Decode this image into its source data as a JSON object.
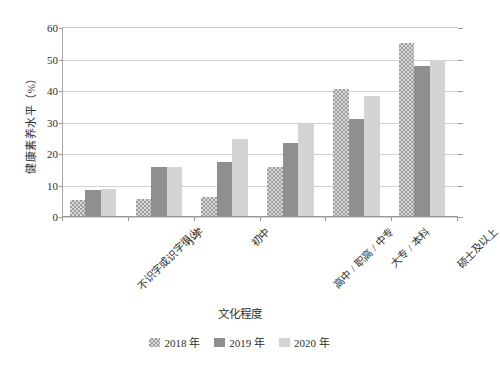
{
  "chart_data": {
    "type": "bar",
    "title": "",
    "xlabel": "文化程度",
    "ylabel": "健康素养水平（%）",
    "categories": [
      "不识字或识字很少",
      "小学",
      "初中",
      "高中 / 职高 / 中专",
      "大专 / 本科",
      "硕士及以上"
    ],
    "series": [
      {
        "name": "2018 年",
        "color": "#d9d9d9",
        "pattern": "checkered",
        "values": [
          5.5,
          5.7,
          6.5,
          16.0,
          40.5,
          55.4
        ]
      },
      {
        "name": "2019 年",
        "color": "#8f8f8f",
        "pattern": "solid",
        "values": [
          8.5,
          15.8,
          17.5,
          23.5,
          31.0,
          48.0
        ]
      },
      {
        "name": "2020 年",
        "color": "#d4d4d4",
        "pattern": "solid",
        "values": [
          8.8,
          15.8,
          24.8,
          29.5,
          38.5,
          50.0
        ]
      }
    ],
    "ylim": [
      0,
      60
    ],
    "yticks": [
      0,
      10,
      20,
      30,
      40,
      50,
      60
    ],
    "ytick_labels": [
      "0",
      "10",
      "20",
      "30",
      "40",
      "50",
      "60"
    ],
    "grid": true,
    "legend_position": "bottom",
    "legend_entries": [
      "2018 年",
      "2019 年",
      "2020 年"
    ]
  }
}
